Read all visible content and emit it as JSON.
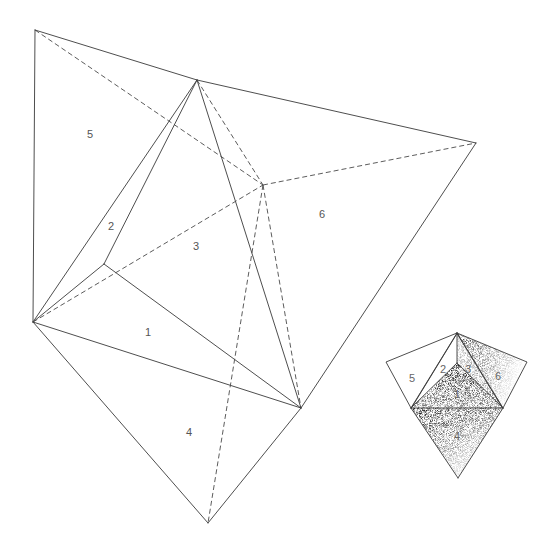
{
  "diagram": {
    "type": "polyhedron-net-with-assembled-view",
    "net": {
      "vertices": {
        "A": [
          35,
          30
        ],
        "B": [
          197,
          80
        ],
        "C": [
          476,
          143
        ],
        "D": [
          263,
          185
        ],
        "E": [
          104,
          264
        ],
        "F": [
          33,
          322
        ],
        "G": [
          301,
          408
        ],
        "H": [
          208,
          523
        ]
      },
      "solid_edges": [
        [
          "A",
          "B"
        ],
        [
          "B",
          "C"
        ],
        [
          "A",
          "F"
        ],
        [
          "C",
          "G"
        ],
        [
          "F",
          "B"
        ],
        [
          "E",
          "B"
        ],
        [
          "F",
          "E"
        ],
        [
          "E",
          "G"
        ],
        [
          "F",
          "G"
        ],
        [
          "B",
          "G"
        ],
        [
          "F",
          "H"
        ],
        [
          "G",
          "H"
        ]
      ],
      "dashed_edges": [
        [
          "A",
          "D"
        ],
        [
          "B",
          "D"
        ],
        [
          "D",
          "C"
        ],
        [
          "F",
          "D"
        ],
        [
          "D",
          "G"
        ],
        [
          "D",
          "H"
        ]
      ],
      "face_labels": [
        {
          "text": "5",
          "x": 91,
          "y": 134
        },
        {
          "text": "2",
          "x": 112,
          "y": 226
        },
        {
          "text": "3",
          "x": 197,
          "y": 246
        },
        {
          "text": "6",
          "x": 323,
          "y": 214
        },
        {
          "text": "1",
          "x": 148,
          "y": 332
        },
        {
          "text": "4",
          "x": 190,
          "y": 432
        }
      ]
    },
    "assembled": {
      "vertices": {
        "P": [
          457,
          333
        ],
        "Q": [
          457,
          363
        ],
        "L": [
          411,
          408
        ],
        "R": [
          503,
          408
        ],
        "Bot": [
          458,
          478
        ],
        "WL": [
          386,
          362
        ],
        "WR": [
          527,
          362
        ]
      },
      "face_labels": [
        {
          "text": "5",
          "x": 413,
          "y": 378
        },
        {
          "text": "2",
          "x": 444,
          "y": 369
        },
        {
          "text": "3",
          "x": 469,
          "y": 369
        },
        {
          "text": "6",
          "x": 499,
          "y": 376
        },
        {
          "text": "1",
          "x": 457,
          "y": 394
        },
        {
          "text": "4",
          "x": 458,
          "y": 436
        }
      ]
    }
  }
}
